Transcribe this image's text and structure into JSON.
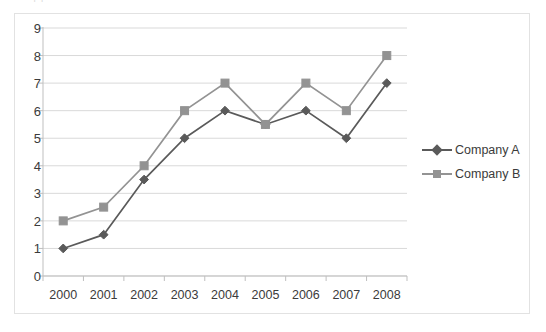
{
  "top_strip": {
    "ghost_text": "clipped text line above chart"
  },
  "chart_data": {
    "type": "line",
    "title": "",
    "subtitle": "",
    "xlabel": "",
    "ylabel": "",
    "categories": [
      "2000",
      "2001",
      "2002",
      "2003",
      "2004",
      "2005",
      "2006",
      "2007",
      "2008"
    ],
    "series": [
      {
        "name": "Company A",
        "marker": "diamond",
        "color": "#5a5a5a",
        "values": [
          1,
          1.5,
          3.5,
          5,
          6,
          5.5,
          6,
          5,
          7
        ]
      },
      {
        "name": "Company B",
        "marker": "square",
        "color": "#939393",
        "values": [
          2,
          2.5,
          4,
          6,
          7,
          5.5,
          7,
          6,
          8
        ]
      }
    ],
    "ylim": [
      0,
      9
    ],
    "ytick_values": [
      0,
      1,
      2,
      3,
      4,
      5,
      6,
      7,
      8,
      9
    ],
    "ytick_labels": [
      "0",
      "1",
      "2",
      "3",
      "4",
      "5",
      "6",
      "7",
      "8",
      "9"
    ],
    "grid": "horizontal",
    "legend_position": "right",
    "axis_color": "#bfbfbf",
    "grid_color": "#d9d9d9",
    "border_color": "#e2e2e2",
    "background": "#ffffff"
  }
}
